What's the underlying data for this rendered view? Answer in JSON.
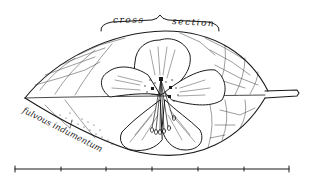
{
  "illustration": {
    "subject": "leaf with flower",
    "labels": {
      "cross_left": "cross",
      "cross_right": "section",
      "indumentum": "fulvous indumentum"
    },
    "scale_bar": {
      "ticks": 7,
      "segments": 6
    },
    "colors": {
      "ink": "#1a1a1a",
      "background": "#ffffff"
    }
  }
}
